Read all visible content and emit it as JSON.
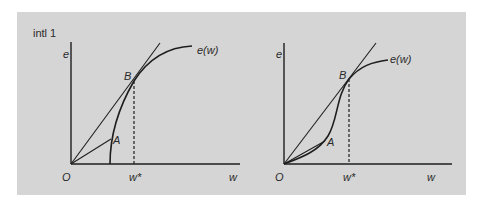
{
  "figure": {
    "title": "intl 1",
    "background_color": "#d5d5d5",
    "line_color": "#1e1e1e"
  },
  "left_panel": {
    "y_axis_label": "e",
    "x_axis_label": "w",
    "origin_label": "O",
    "point_a_label": "A",
    "point_b_label": "B",
    "wstar_label": "w*",
    "curve_label": "e(w)"
  },
  "right_panel": {
    "y_axis_label": "e",
    "x_axis_label": "w",
    "origin_label": "O",
    "point_a_label": "A",
    "point_b_label": "B",
    "wstar_label": "w*",
    "curve_label": "e(w)"
  }
}
